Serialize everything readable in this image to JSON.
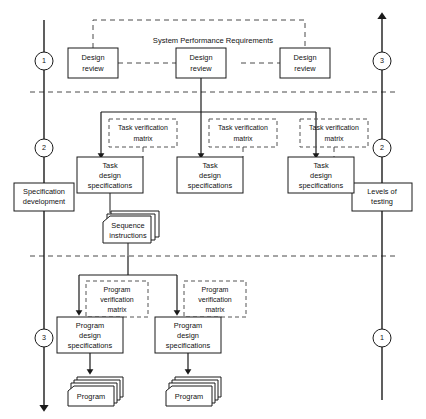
{
  "diagram": {
    "title": "System Performance Requirements",
    "lanes": {
      "left": {
        "name": "development-axis",
        "direction": "down",
        "markers": [
          "1",
          "2",
          "3"
        ],
        "boxes": [
          "Specification development"
        ]
      },
      "right": {
        "name": "testing-axis",
        "direction": "up",
        "markers": [
          "3",
          "2",
          "1"
        ],
        "boxes": [
          "Levels of testing"
        ]
      }
    },
    "design_reviews": [
      {
        "id": "design-review-left",
        "label_line1": "Design",
        "label_line2": "review"
      },
      {
        "id": "design-review-center",
        "label_line1": "Design",
        "label_line2": "review"
      },
      {
        "id": "design-review-right",
        "label_line1": "Design",
        "label_line2": "review"
      }
    ],
    "task_verification_matrices": [
      {
        "id": "task-verification-matrix-1",
        "label_line1": "Task verification",
        "label_line2": "matrix"
      },
      {
        "id": "task-verification-matrix-2",
        "label_line1": "Task verification",
        "label_line2": "matrix"
      },
      {
        "id": "task-verification-matrix-3",
        "label_line1": "Task verification",
        "label_line2": "matrix"
      }
    ],
    "task_design_specifications": [
      {
        "id": "task-design-specifications-1",
        "label_line1": "Task",
        "label_line2": "design",
        "label_line3": "specifications"
      },
      {
        "id": "task-design-specifications-2",
        "label_line1": "Task",
        "label_line2": "design",
        "label_line3": "specifications"
      },
      {
        "id": "task-design-specifications-3",
        "label_line1": "Task",
        "label_line2": "design",
        "label_line3": "specifications"
      }
    ],
    "sequence_instructions": {
      "id": "sequence-instructions",
      "label_line1": "Sequence",
      "label_line2": "instructions"
    },
    "program_verification_matrices": [
      {
        "id": "program-verification-matrix-1",
        "label_line1": "Program",
        "label_line2": "verification",
        "label_line3": "matrix"
      },
      {
        "id": "program-verification-matrix-2",
        "label_line1": "Program",
        "label_line2": "verification",
        "label_line3": "matrix"
      }
    ],
    "program_design_specifications": [
      {
        "id": "program-design-specifications-1",
        "label_line1": "Program",
        "label_line2": "design",
        "label_line3": "specifications"
      },
      {
        "id": "program-design-specifications-2",
        "label_line1": "Program",
        "label_line2": "design",
        "label_line3": "specifications"
      }
    ],
    "programs": [
      {
        "id": "program-stack-1",
        "label": "Program"
      },
      {
        "id": "program-stack-2",
        "label": "Program"
      }
    ],
    "specification_development": {
      "label_line1": "Specification",
      "label_line2": "development"
    },
    "levels_of_testing": {
      "label_line1": "Levels of",
      "label_line2": "testing"
    },
    "colors": {
      "stroke": "#1a1a1a",
      "dashed_stroke": "#4a4a4a",
      "background": "#ffffff"
    }
  }
}
